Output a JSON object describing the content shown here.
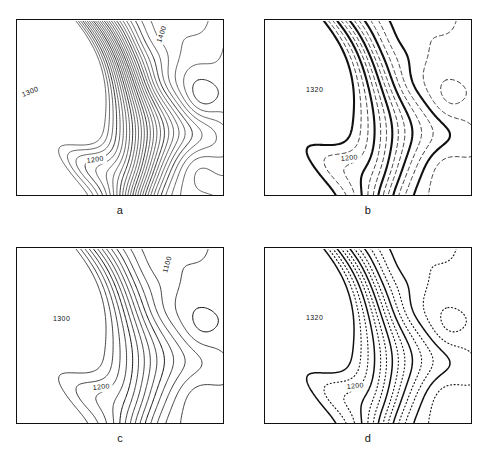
{
  "figure": {
    "background_color": "#ffffff",
    "line_color": "#111111",
    "width": 493,
    "height": 453
  },
  "panels": [
    {
      "id": "a",
      "letter": "a",
      "style_name": "dense-thin-contours",
      "description": "Dense uniform thin contour lines, no index emphasis",
      "frame": {
        "x": 16,
        "y": 19,
        "width": 208,
        "height": 177
      },
      "line_weights": {
        "index": 0.85,
        "intermediate": 0.65
      },
      "dash_pattern": "none",
      "contour_interval": 20,
      "labels": [
        {
          "text": "1300",
          "x": 22,
          "y": 96,
          "rotate": -22
        },
        {
          "text": "1200",
          "x": 86,
          "y": 162,
          "rotate": -8
        },
        {
          "text": "1400",
          "x": 160,
          "y": 42,
          "rotate": -72
        }
      ]
    },
    {
      "id": "b",
      "letter": "b",
      "style_name": "bold-index-dashed-intermediate",
      "description": "Heavy index contours with dashed intermediate contours",
      "frame": {
        "x": 264,
        "y": 19,
        "width": 208,
        "height": 177
      },
      "line_weights": {
        "index": 2.1,
        "intermediate": 0.8
      },
      "dash_pattern": "4,3",
      "contour_interval": 40,
      "labels": [
        {
          "text": "1320",
          "x": 305,
          "y": 91,
          "rotate": 0
        },
        {
          "text": "1200",
          "x": 340,
          "y": 160,
          "rotate": -6
        }
      ]
    },
    {
      "id": "c",
      "letter": "c",
      "style_name": "medium-solid-contours",
      "description": "Moderate density solid contours, uniform weight",
      "frame": {
        "x": 16,
        "y": 247,
        "width": 208,
        "height": 177
      },
      "line_weights": {
        "index": 1.0,
        "intermediate": 0.8
      },
      "dash_pattern": "none",
      "contour_interval": 40,
      "labels": [
        {
          "text": "1300",
          "x": 52,
          "y": 320,
          "rotate": 0
        },
        {
          "text": "1200",
          "x": 92,
          "y": 389,
          "rotate": -6
        },
        {
          "text": "1100",
          "x": 166,
          "y": 272,
          "rotate": -74
        }
      ]
    },
    {
      "id": "d",
      "letter": "d",
      "style_name": "bold-index-dotted-intermediate",
      "description": "Heavy index contours with dotted intermediate contours",
      "frame": {
        "x": 264,
        "y": 247,
        "width": 208,
        "height": 177
      },
      "line_weights": {
        "index": 1.5,
        "intermediate": 1.1
      },
      "dash_pattern": "1,2.6",
      "contour_interval": 40,
      "labels": [
        {
          "text": "1320",
          "x": 305,
          "y": 319,
          "rotate": 0
        },
        {
          "text": "1200",
          "x": 346,
          "y": 388,
          "rotate": -6
        }
      ]
    }
  ],
  "chart_data": {
    "type": "line",
    "xlabel": "",
    "ylabel": "",
    "grid": false,
    "legend_position": "none",
    "subplot_letters": [
      "a",
      "b",
      "c",
      "d"
    ],
    "elevation_labels_shown": [
      "1100",
      "1200",
      "1300",
      "1320",
      "1400"
    ],
    "elevation_units": "meters",
    "elevation_min_labeled": 1100,
    "elevation_max_labeled": 1400,
    "panel_styles": [
      "dense thin contours, 20 m interval",
      "bold index contours, dashed intermediates, 40 m interval",
      "medium solid contours, 40 m interval",
      "bold index contours, dotted intermediates, 40 m interval"
    ]
  }
}
